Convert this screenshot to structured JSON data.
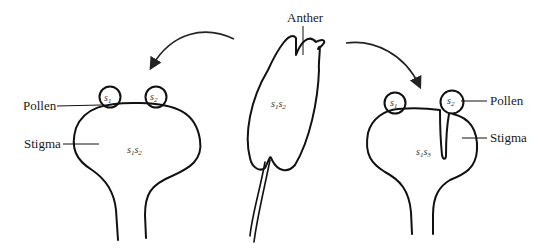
{
  "diagram": {
    "colors": {
      "line": "#111111",
      "background": "#ffffff"
    },
    "left_pistil": {
      "pollen_label": "Pollen",
      "stigma_label": "Stigma",
      "genotype": {
        "a": "s",
        "a_sub": "1",
        "b": "s",
        "b_sub": "2"
      },
      "pollen_grains": [
        {
          "letter": "s",
          "sub": "1"
        },
        {
          "letter": "s",
          "sub": "2"
        }
      ]
    },
    "anther": {
      "label": "Anther",
      "genotype": {
        "a": "s",
        "a_sub": "1",
        "b": "s",
        "b_sub": "2"
      }
    },
    "right_pistil": {
      "pollen_label": "Pollen",
      "stigma_label": "Stigma",
      "genotype": {
        "a": "s",
        "a_sub": "1",
        "b": "s",
        "b_sub": "3"
      },
      "pollen_grains": [
        {
          "letter": "s",
          "sub": "1"
        },
        {
          "letter": "s",
          "sub": "2"
        }
      ]
    },
    "arrows": [
      {
        "name": "anther-to-left-pistil",
        "direction": "left"
      },
      {
        "name": "anther-to-right-pistil",
        "direction": "right"
      }
    ]
  }
}
